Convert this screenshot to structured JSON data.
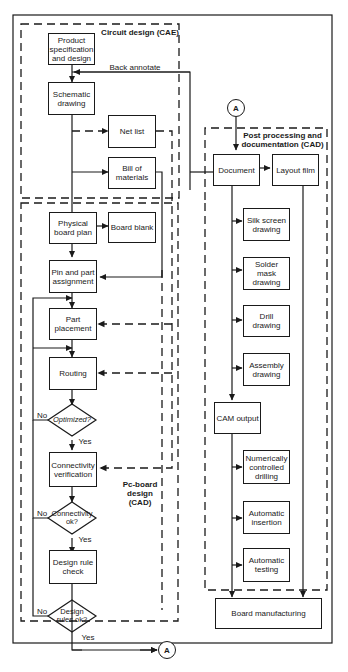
{
  "regions": {
    "circuit_design": "Circuit design (CAE)",
    "pcboard_design": "Pc-board design (CAD)",
    "post_processing": "Post processing and documentation (CAD)"
  },
  "boxes": {
    "product_spec": "Product specification and design",
    "schematic": "Schematic drawing",
    "net_list": "Net list",
    "bill_of_materials": "Bill of materials",
    "physical_board_plan": "Physical board plan",
    "board_blank": "Board blank",
    "pin_part_assignment": "Pin and part assignment",
    "part_placement": "Part placement",
    "routing": "Routing",
    "connectivity_verification": "Connectivity verification",
    "design_rule_check": "Design rule check",
    "document": "Document",
    "layout_film": "Layout film",
    "silk_screen": "Silk screen drawing",
    "solder_mask": "Solder mask drawing",
    "drill_drawing": "Drill drawing",
    "assembly_drawing": "Assembly drawing",
    "cam_output": "CAM output",
    "nc_drilling": "Numerically controlled drilling",
    "auto_insertion": "Automatic insertion",
    "auto_testing": "Automatic testing",
    "board_manufacturing": "Board manufacturing"
  },
  "decisions": {
    "optimized": "Optimized?",
    "connectivity_ok": "Connectivity ok?",
    "design_rules_ok": "Design rules ok?"
  },
  "edge_labels": {
    "back_annotate": "Back annotate",
    "no": "No",
    "yes": "Yes"
  },
  "connector": "A"
}
